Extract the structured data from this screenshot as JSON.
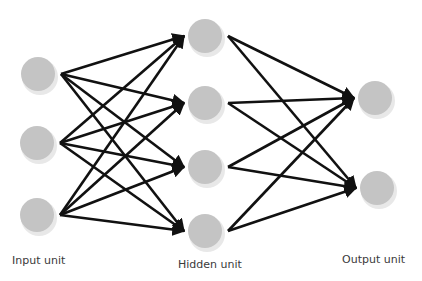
{
  "diagram": {
    "type": "neural-network",
    "node_fill": "#c4c4c4",
    "node_shadow": "#e8e8e8",
    "edge_color": "#111111",
    "background": "#ffffff",
    "layers": [
      {
        "name": "input",
        "label": "Input unit",
        "count": 3
      },
      {
        "name": "hidden",
        "label": "Hidden unit",
        "count": 4
      },
      {
        "name": "output",
        "label": "Output unit",
        "count": 2
      }
    ],
    "connections": "fully-connected feedforward (input→hidden, hidden→output), arrowheads on target"
  },
  "labels": {
    "input": "Input unit",
    "hidden": "Hidden unit",
    "output": "Output unit"
  }
}
